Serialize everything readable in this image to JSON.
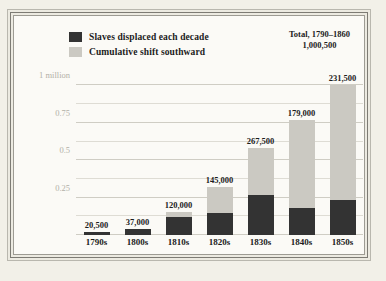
{
  "chart_data": {
    "type": "bar",
    "subtype": "stacked-bar",
    "title": "",
    "xlabel": "",
    "ylabel": "",
    "categories": [
      "1790s",
      "1800s",
      "1810s",
      "1820s",
      "1830s",
      "1840s",
      "1850s"
    ],
    "series": [
      {
        "name": "Slaves displaced each decade",
        "color": "#333333",
        "values": [
          20500,
          37000,
          120000,
          145000,
          267500,
          179000,
          231500
        ],
        "value_labels": [
          "20,500",
          "37,000",
          "120,000",
          "145,000",
          "267,500",
          "179,000",
          "231,500"
        ]
      },
      {
        "name": "Cumulative shift southward",
        "color": "#cbc9c2",
        "values": [
          0,
          0,
          35000,
          175000,
          317500,
          591000,
          769000
        ],
        "cumulative_totals": [
          20500,
          37000,
          155000,
          320000,
          585000,
          770000,
          1000500
        ]
      }
    ],
    "ylim": [
      0,
      1050000
    ],
    "yticks": [
      250000,
      500000,
      750000,
      1000000
    ],
    "ytick_labels": [
      "0.25",
      "0.5",
      "0.75",
      "1 million"
    ],
    "minor_gridline_step": 125000,
    "grid": true,
    "legend_position": "top-left",
    "annotation": {
      "line1": "Total, 1790–1860",
      "line2": "1,000,500"
    }
  },
  "legend": {
    "items": [
      {
        "label": "Slaves displaced each decade",
        "color": "#333333"
      },
      {
        "label": "Cumulative shift southward",
        "color": "#cbc9c2"
      }
    ]
  },
  "colors": {
    "page_background": "#f2f0e8",
    "plot_background": "#fbfaf6",
    "dark_series": "#333333",
    "light_series": "#cbc9c2",
    "gridline": "#dedcd4",
    "tick_text": "#b2b0a7",
    "label_text": "#1c1c1c"
  }
}
